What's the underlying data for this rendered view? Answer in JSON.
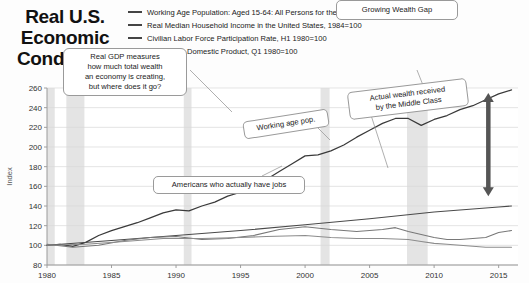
{
  "title": {
    "line1": "Real U.S.",
    "line2": "Economic",
    "line3": "Conditions"
  },
  "legend": {
    "position": "top",
    "items": [
      {
        "label": "Working Age Population: Aged 15-64: All Persons for the United States©, H1 1979=100",
        "color": "#3d3d3d"
      },
      {
        "label": "Real Median Household Income in the United States, 1984=100",
        "color": "#4a4a4a"
      },
      {
        "label": "Civilian Labor Force Participation Rate, H1 1980=100",
        "color": "#555555"
      },
      {
        "label": "Real Gross Domestic Product, Q1 1980=100",
        "color": "#6b6b6b"
      }
    ]
  },
  "annotations": [
    {
      "name": "gdp-note",
      "text": "Real GDP measures\nhow much total wealth\nan economy is creating,\nbut where does it go?"
    },
    {
      "name": "growing-wealth-gap",
      "text": "Growing Wealth Gap"
    },
    {
      "name": "middle-class-note",
      "text": "Actual wealth received\nby the Middle Class"
    },
    {
      "name": "working-age-note",
      "text": "Working age pop."
    },
    {
      "name": "jobs-note",
      "text": "Americans who actually have jobs"
    }
  ],
  "chart_data": {
    "type": "line",
    "title": "Real U.S. Economic Conditions",
    "xlabel": "",
    "ylabel": "Index",
    "xlim": [
      1980,
      2016.5
    ],
    "ylim": [
      80,
      260
    ],
    "yticks": [
      80,
      100,
      120,
      140,
      160,
      180,
      200,
      220,
      240,
      260
    ],
    "xticks": [
      1980,
      1985,
      1990,
      1995,
      2000,
      2005,
      2010,
      2015
    ],
    "grid": true,
    "recession_bands": [
      {
        "start": 1980.0,
        "end": 1980.6
      },
      {
        "start": 1981.5,
        "end": 1982.9
      },
      {
        "start": 1990.6,
        "end": 1991.2
      },
      {
        "start": 2001.2,
        "end": 2001.9
      },
      {
        "start": 2007.9,
        "end": 2009.5
      }
    ],
    "series": [
      {
        "name": "Real Gross Domestic Product, Q1 1980=100",
        "color": "#3a3a3a",
        "x": [
          1980,
          1981,
          1982,
          1983,
          1984,
          1985,
          1986,
          1987,
          1988,
          1989,
          1990,
          1991,
          1992,
          1993,
          1994,
          1995,
          1996,
          1997,
          1998,
          1999,
          2000,
          2001,
          2002,
          2003,
          2004,
          2005,
          2006,
          2007,
          2008,
          2009,
          2010,
          2011,
          2012,
          2013,
          2014,
          2015,
          2016
        ],
        "values": [
          100,
          101,
          99,
          103,
          110,
          115,
          119,
          123,
          128,
          133,
          136,
          135,
          140,
          144,
          150,
          154,
          160,
          167,
          175,
          183,
          191,
          192,
          196,
          202,
          210,
          217,
          224,
          229,
          229,
          222,
          228,
          232,
          238,
          242,
          248,
          254,
          258
        ]
      },
      {
        "name": "Working Age Population: Aged 15-64: All Persons for the United States, H1 1979=100",
        "color": "#4a4a4a",
        "x": [
          1980,
          1985,
          1990,
          1995,
          2000,
          2005,
          2010,
          2015,
          2016
        ],
        "values": [
          100,
          105,
          110,
          115,
          121,
          127,
          134,
          139,
          140
        ]
      },
      {
        "name": "Real Median Household Income in the United States, 1984=100",
        "color": "#787878",
        "x": [
          1980,
          1982,
          1984,
          1986,
          1988,
          1990,
          1992,
          1994,
          1996,
          1998,
          2000,
          2002,
          2004,
          2006,
          2007,
          2008,
          2009,
          2010,
          2011,
          2012,
          2013,
          2014,
          2015,
          2016
        ],
        "values": [
          101,
          98,
          100,
          105,
          108,
          109,
          106,
          107,
          110,
          116,
          119,
          116,
          114,
          116,
          118,
          114,
          111,
          108,
          106,
          106,
          107,
          108,
          113,
          115
        ]
      },
      {
        "name": "Civilian Labor Force Participation Rate, H1 1980=100",
        "color": "#8c8c8c",
        "x": [
          1980,
          1983,
          1986,
          1989,
          1992,
          1995,
          1997,
          2000,
          2002,
          2004,
          2006,
          2008,
          2009,
          2010,
          2011,
          2012,
          2013,
          2014,
          2015,
          2016
        ],
        "values": [
          100,
          101,
          104,
          107,
          107,
          108,
          109,
          110,
          108,
          107,
          107,
          106,
          104,
          102,
          101,
          100,
          99,
          98,
          98,
          98
        ]
      }
    ],
    "gap_arrow": {
      "name": "growing-wealth-gap-arrow",
      "x": 2014.2,
      "y_top": 255,
      "y_bottom": 150,
      "color": "#555555"
    }
  }
}
